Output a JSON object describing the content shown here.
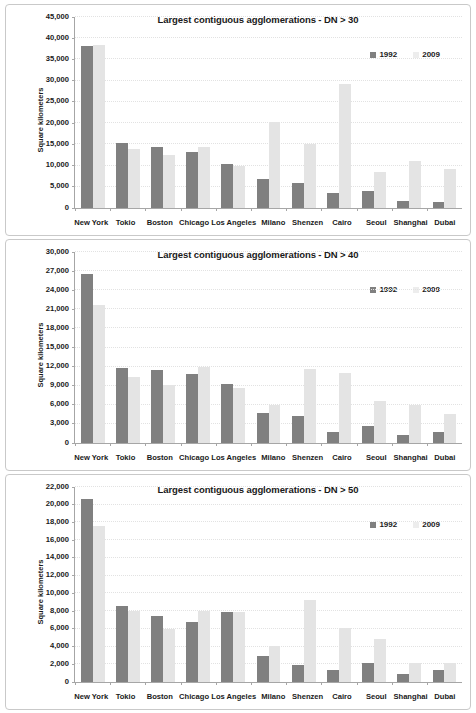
{
  "legend": {
    "series1": "1992",
    "series2": "2009",
    "position": "top-right"
  },
  "axis": {
    "ylabel": "Square kilometers"
  },
  "colors": {
    "series1": "#808080",
    "series2": "#e4e4e4"
  },
  "chart_data": [
    {
      "type": "bar",
      "title": "Largest contiguous agglomerations - DN > 30",
      "xlabel": "",
      "ylabel": "Square kilometers",
      "ylim": [
        0,
        45000
      ],
      "yticks": [
        0,
        5000,
        10000,
        15000,
        20000,
        25000,
        30000,
        35000,
        40000,
        45000
      ],
      "ytick_labels": [
        "0",
        "5,000",
        "10,000",
        "15,000",
        "20,000",
        "25,000",
        "30,000",
        "35,000",
        "40,000",
        "45,000"
      ],
      "grid": true,
      "categories": [
        "New York",
        "Tokio",
        "Boston",
        "Chicago",
        "Los Angeles",
        "Milano",
        "Shenzen",
        "Cairo",
        "Seoul",
        "Shanghai",
        "Dubai"
      ],
      "series": [
        {
          "name": "1992",
          "values": [
            38100,
            15400,
            14300,
            13300,
            10400,
            6900,
            6000,
            3500,
            3900,
            1700,
            1400
          ]
        },
        {
          "name": "2009",
          "values": [
            38400,
            13900,
            12600,
            14300,
            9800,
            20300,
            15200,
            29300,
            8400,
            11000,
            9200
          ]
        }
      ]
    },
    {
      "type": "bar",
      "title": "Largest contiguous agglomerations - DN > 40",
      "xlabel": "",
      "ylabel": "Square kilometers",
      "ylim": [
        0,
        30000
      ],
      "yticks": [
        0,
        3000,
        6000,
        9000,
        12000,
        15000,
        18000,
        21000,
        24000,
        27000,
        30000
      ],
      "ytick_labels": [
        "0",
        "3,000",
        "6,000",
        "9,000",
        "12,000",
        "15,000",
        "18,000",
        "21,000",
        "24,000",
        "27,000",
        "30,000"
      ],
      "grid": true,
      "categories": [
        "New York",
        "Tokio",
        "Boston",
        "Chicago",
        "Los Angeles",
        "Milano",
        "Shenzen",
        "Cairo",
        "Seoul",
        "Shanghai",
        "Dubai"
      ],
      "series": [
        {
          "name": "1992",
          "values": [
            26600,
            11800,
            11500,
            10800,
            9200,
            4700,
            4200,
            1800,
            2700,
            1200,
            1700
          ]
        },
        {
          "name": "2009",
          "values": [
            21700,
            10400,
            9100,
            12000,
            8600,
            5900,
            11700,
            11000,
            6600,
            5900,
            4600
          ]
        }
      ]
    },
    {
      "type": "bar",
      "title": "Largest contiguous agglomerations - DN > 50",
      "xlabel": "",
      "ylabel": "Square kilometers",
      "ylim": [
        0,
        22000
      ],
      "yticks": [
        0,
        2000,
        4000,
        6000,
        8000,
        10000,
        12000,
        14000,
        16000,
        18000,
        20000,
        22000
      ],
      "ytick_labels": [
        "0",
        "2,000",
        "4,000",
        "6,000",
        "8,000",
        "10,000",
        "12,000",
        "14,000",
        "16,000",
        "18,000",
        "20,000",
        "22,000"
      ],
      "grid": true,
      "categories": [
        "New York",
        "Tokio",
        "Boston",
        "Chicago",
        "Los Angeles",
        "Milano",
        "Shenzen",
        "Cairo",
        "Seoul",
        "Shanghai",
        "Dubai"
      ],
      "series": [
        {
          "name": "1992",
          "values": [
            20600,
            8600,
            7500,
            6800,
            7900,
            2900,
            1900,
            1400,
            2100,
            900,
            1300
          ]
        },
        {
          "name": "2009",
          "values": [
            17600,
            8000,
            6000,
            8000,
            7900,
            4100,
            9200,
            6100,
            4900,
            2100,
            2100
          ]
        }
      ]
    }
  ]
}
